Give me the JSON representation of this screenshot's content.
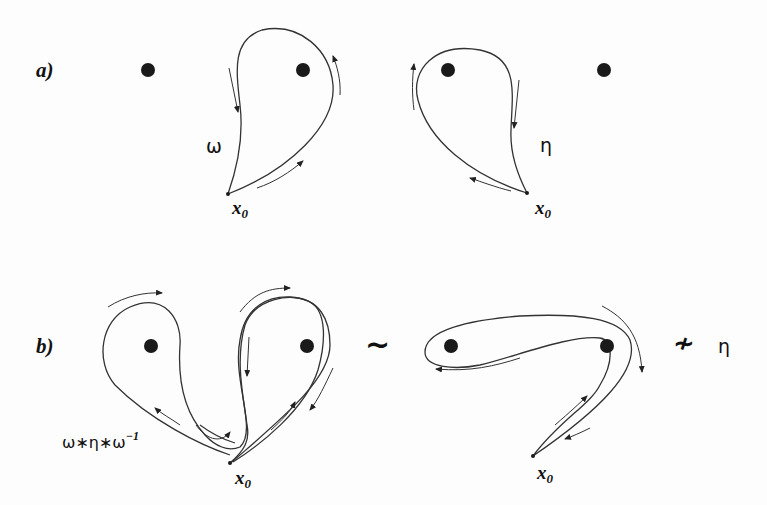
{
  "figure": {
    "panel_a": {
      "label": "a)",
      "left_path_label": "ω",
      "right_path_label": "η",
      "basepoint_label": "x",
      "basepoint_sub": "0"
    },
    "panel_b": {
      "label": "b)",
      "composite_label": "ω∗η∗ω",
      "composite_exp": "−1",
      "homotopic_symbol": "~",
      "not_homotopic_symbol": "≁",
      "rhs_label": "η",
      "basepoint_label": "x",
      "basepoint_sub": "0"
    },
    "colors": {
      "ink": "#1a1a1a",
      "curve": "#333333",
      "background": "#fdfdfd"
    }
  }
}
